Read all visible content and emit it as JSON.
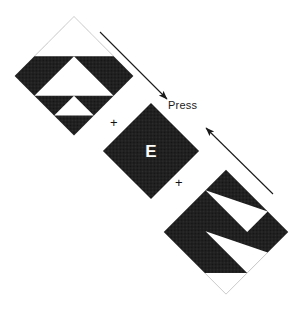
{
  "figure": {
    "title": "",
    "background_color": "#ffffff",
    "width": 302,
    "height": 310,
    "ink_color": "#161616",
    "paper_color": "#ffffff"
  },
  "labels": {
    "press": "Press",
    "target_letter": "E",
    "fixation_upper": "+",
    "fixation_lower": "+"
  },
  "stimuli": [
    {
      "id": "top-left-pattern",
      "name": "peripheral-pattern-upper-left",
      "role": "texture-pattern",
      "fill": "#161616",
      "cutout_fill": "#ffffff",
      "center_x": 74,
      "center_y": 76,
      "half_diagonal": 60,
      "rotation_deg": 45,
      "white_triangles": 3
    },
    {
      "id": "center-target",
      "name": "central-target-diamond",
      "role": "target",
      "fill": "#161616",
      "letter": "E",
      "letter_color": "#ffffff",
      "center_x": 151,
      "center_y": 151,
      "half_diagonal": 48,
      "rotation_deg": 45
    },
    {
      "id": "bottom-right-pattern",
      "name": "peripheral-pattern-lower-right",
      "role": "texture-pattern",
      "fill": "#161616",
      "cutout_fill": "#ffffff",
      "center_x": 226,
      "center_y": 232,
      "half_diagonal": 63,
      "rotation_deg": 45,
      "white_triangles": 3
    }
  ],
  "arrows": [
    {
      "id": "arrow-top",
      "name": "arrow-inbound-upper",
      "from_x": 100,
      "from_y": 32,
      "to_x": 169,
      "to_y": 100,
      "direction": "down-right",
      "color": "#1a1a1a"
    },
    {
      "id": "arrow-bottom",
      "name": "arrow-inbound-lower",
      "from_x": 273,
      "from_y": 194,
      "to_x": 204,
      "to_y": 126,
      "direction": "up-left",
      "color": "#1a1a1a"
    }
  ]
}
